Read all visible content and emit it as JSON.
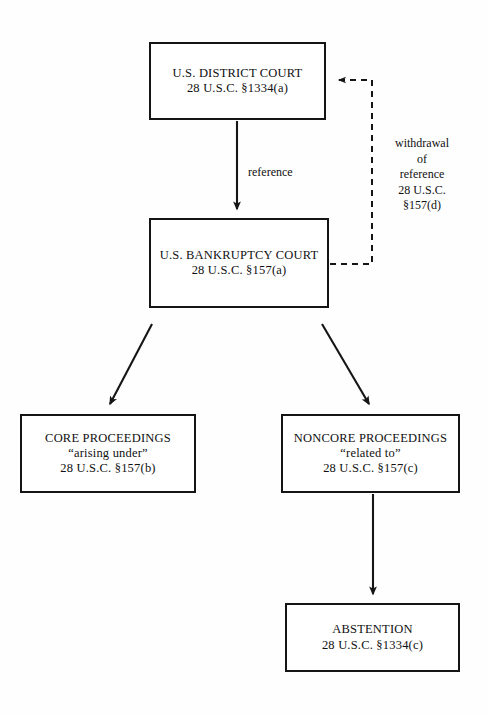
{
  "diagram": {
    "background_color": "#fefefe",
    "line_color": "#151515",
    "text_color": "#101010",
    "nodes": [
      {
        "id": "district-court",
        "name": "district-court-box",
        "title": "U.S. DISTRICT COURT",
        "citation": "28 U.S.C. §1334(a)",
        "x": 149,
        "y": 42,
        "w": 177,
        "h": 78
      },
      {
        "id": "bankruptcy-court",
        "name": "bankruptcy-court-box",
        "title": "U.S. BANKRUPTCY COURT",
        "citation": "28 U.S.C. §157(a)",
        "x": 149,
        "y": 218,
        "w": 180,
        "h": 90
      },
      {
        "id": "core-proceedings",
        "name": "core-proceedings-box",
        "title": "CORE PROCEEDINGS",
        "quote": "“arising under”",
        "citation": "28 U.S.C. §157(b)",
        "x": 20,
        "y": 414,
        "w": 176,
        "h": 79
      },
      {
        "id": "noncore-proceedings",
        "name": "noncore-proceedings-box",
        "title": "NONCORE PROCEEDINGS",
        "quote": "“related to”",
        "citation": "28 U.S.C. §157(c)",
        "x": 281,
        "y": 414,
        "w": 179,
        "h": 79
      },
      {
        "id": "abstention",
        "name": "abstention-box",
        "title": "ABSTENTION",
        "citation": "28 U.S.C. §1334(c)",
        "x": 285,
        "y": 603,
        "w": 175,
        "h": 69
      }
    ],
    "edge_labels": {
      "reference": {
        "text": "reference",
        "x": 248,
        "y": 165
      },
      "withdrawal": {
        "lines": [
          "withdrawal",
          "of",
          "reference",
          "28 U.S.C.",
          "§157(d)"
        ],
        "x": 422,
        "y": 136
      }
    },
    "edges": [
      {
        "id": "reference-edge",
        "name": "reference-arrow",
        "from": "district-court",
        "to": "bankruptcy-court",
        "style": "solid",
        "label": "reference"
      },
      {
        "id": "withdrawal-edge",
        "name": "withdrawal-of-reference-arrow",
        "from": "bankruptcy-court",
        "to": "district-court",
        "style": "dashed",
        "label": "withdrawal of reference 28 U.S.C. §157(d)"
      },
      {
        "id": "core-edge",
        "name": "core-proceedings-arrow",
        "from": "bankruptcy-court",
        "to": "core-proceedings",
        "style": "solid",
        "label": ""
      },
      {
        "id": "noncore-edge",
        "name": "noncore-proceedings-arrow",
        "from": "bankruptcy-court",
        "to": "noncore-proceedings",
        "style": "solid",
        "label": ""
      },
      {
        "id": "abstention-edge",
        "name": "abstention-arrow",
        "from": "noncore-proceedings",
        "to": "abstention",
        "style": "solid",
        "label": ""
      }
    ]
  }
}
